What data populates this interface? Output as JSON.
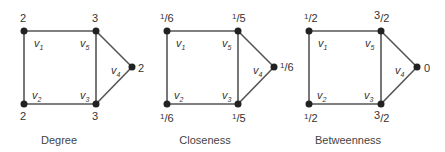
{
  "figure": {
    "graph": {
      "vertices": [
        {
          "id": "v1",
          "name": "v",
          "sub": "1"
        },
        {
          "id": "v2",
          "name": "v",
          "sub": "2"
        },
        {
          "id": "v3",
          "name": "v",
          "sub": "3"
        },
        {
          "id": "v4",
          "name": "v",
          "sub": "4"
        },
        {
          "id": "v5",
          "name": "v",
          "sub": "5"
        }
      ],
      "edges": [
        [
          "v1",
          "v5"
        ],
        [
          "v1",
          "v2"
        ],
        [
          "v2",
          "v3"
        ],
        [
          "v5",
          "v3"
        ],
        [
          "v5",
          "v4"
        ],
        [
          "v3",
          "v4"
        ]
      ]
    },
    "panels": [
      {
        "caption": "Degree",
        "values": {
          "v1": {
            "num": "2",
            "den": ""
          },
          "v2": {
            "num": "2",
            "den": ""
          },
          "v3": {
            "num": "3",
            "den": ""
          },
          "v4": {
            "num": "2",
            "den": ""
          },
          "v5": {
            "num": "3",
            "den": ""
          }
        }
      },
      {
        "caption": "Closeness",
        "values": {
          "v1": {
            "num": "1",
            "den": "6"
          },
          "v2": {
            "num": "1",
            "den": "6"
          },
          "v3": {
            "num": "1",
            "den": "5"
          },
          "v4": {
            "num": "1",
            "den": "6"
          },
          "v5": {
            "num": "1",
            "den": "5"
          }
        }
      },
      {
        "caption": "Betweenness",
        "values": {
          "v1": {
            "num": "1",
            "den": "2"
          },
          "v2": {
            "num": "1",
            "den": "2"
          },
          "v3": {
            "num": "3",
            "den": "2"
          },
          "v4": {
            "num": "0",
            "den": ""
          },
          "v5": {
            "num": "3",
            "den": "2"
          }
        }
      }
    ]
  }
}
